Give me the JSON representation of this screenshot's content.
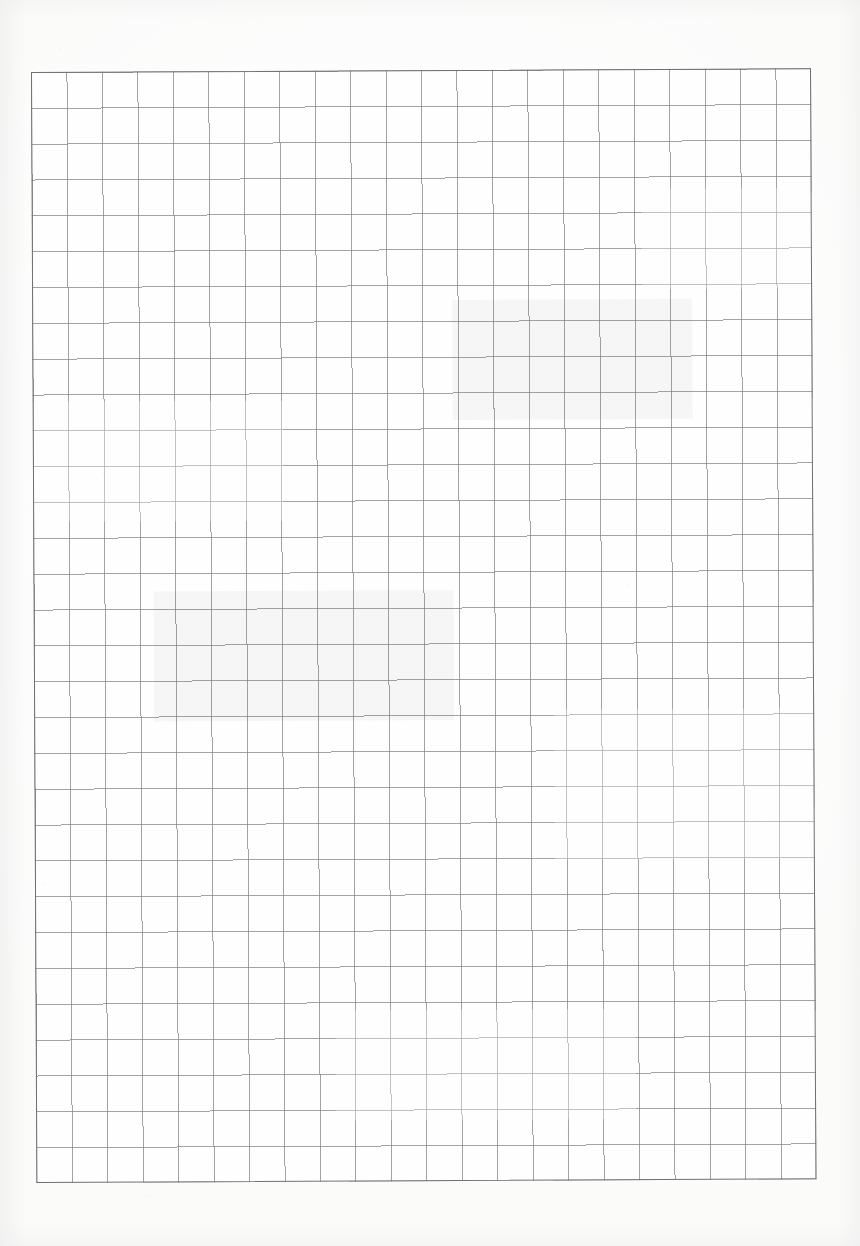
{
  "document": {
    "kind": "scanned-graph-paper",
    "title": "Blank quadrille / graph paper sheet",
    "page_width": 860,
    "page_height": 1246,
    "has_text": false,
    "has_handwriting": false,
    "content_note": "Empty ruled grid; no printed labels, numbers, headings or annotations appear anywhere on the sheet."
  },
  "paper": {
    "background_color": "#fefefe",
    "page_edge_color": "#ffffff",
    "texture": "faint scan speckle and dust",
    "skew_degrees": -0.28
  },
  "grid": {
    "columns": 22,
    "rows": 31,
    "left": 31,
    "top": 72,
    "width": 780,
    "height": 1111,
    "cell_width": 35.45,
    "cell_height": 35.84,
    "line_color": "#7d7f82",
    "line_width_px": 1,
    "border_color": "#6e7073",
    "cell_fill": "#fefefe",
    "style": "uniform single-weight ruling, no bold major lines"
  },
  "margins": {
    "left": 31,
    "right": 49,
    "top": 72,
    "bottom": 63
  }
}
